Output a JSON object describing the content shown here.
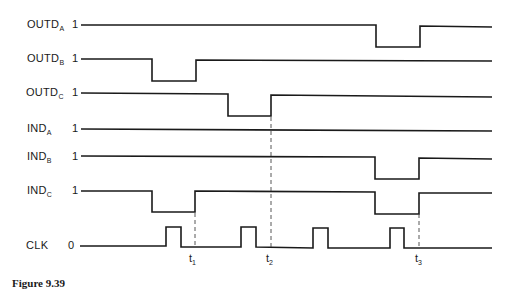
{
  "figure": {
    "caption": "Figure 9.39",
    "signals": [
      {
        "name": "OUTD",
        "sub": "A",
        "level": "1",
        "y": 25,
        "dips": [
          [
            376,
            420
          ]
        ]
      },
      {
        "name": "OUTD",
        "sub": "B",
        "level": "1",
        "y": 59,
        "dips": [
          [
            152,
            196
          ]
        ]
      },
      {
        "name": "OUTD",
        "sub": "C",
        "level": "1",
        "y": 94,
        "dips": [
          [
            228,
            271
          ]
        ]
      },
      {
        "name": "IND",
        "sub": "A",
        "level": "1",
        "y": 129,
        "dips": []
      },
      {
        "name": "IND",
        "sub": "B",
        "level": "1",
        "y": 157,
        "dips": [
          [
            375,
            419
          ]
        ]
      },
      {
        "name": "IND",
        "sub": "C",
        "level": "1",
        "y": 191,
        "dips": [
          [
            152,
            195
          ],
          [
            375,
            419
          ]
        ]
      },
      {
        "name": "CLK",
        "sub": "",
        "level": "0",
        "y": 246,
        "pulses": [
          [
            166,
            181
          ],
          [
            241,
            256
          ],
          [
            313,
            328
          ],
          [
            390,
            404
          ]
        ]
      }
    ],
    "time_markers": [
      {
        "t": "t",
        "sub": "1",
        "x": 195
      },
      {
        "t": "t",
        "sub": "2",
        "x": 271
      },
      {
        "t": "t",
        "sub": "3",
        "x": 419
      }
    ]
  }
}
